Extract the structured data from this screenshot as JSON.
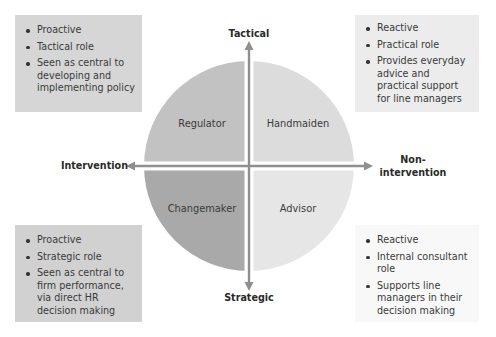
{
  "diagram": {
    "axes": {
      "top": "Tactical",
      "bottom": "Strategic",
      "left": "Intervention",
      "right_line1": "Non-",
      "right_line2": "intervention"
    },
    "quadrants": {
      "top_left": "Regulator",
      "top_right": "Handmaiden",
      "bottom_left": "Changemaker",
      "bottom_right": "Advisor"
    },
    "colors": {
      "top_left": "#c2c2c2",
      "top_right": "#dcdcdc",
      "bottom_left": "#a9a9a9",
      "bottom_right": "#e6e6e6",
      "axis": "#8f8f8f"
    },
    "boxes": {
      "top_left": [
        "Proactive",
        "Tactical role",
        "Seen as central to developing and implementing policy"
      ],
      "top_right": [
        "Reactive",
        "Practical role",
        "Provides everyday advice and practical support for line managers"
      ],
      "bottom_left": [
        "Proactive",
        "Strategic role",
        "Seen as central to firm performance, via direct HR decision making"
      ],
      "bottom_right": [
        "Reactive",
        "Internal consultant role",
        "Supports line managers in their decision making"
      ]
    }
  }
}
